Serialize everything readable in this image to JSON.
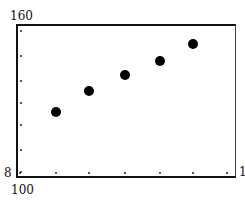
{
  "chart_data": {
    "type": "scatter",
    "title": "",
    "xlabel": "",
    "ylabel": "",
    "tick_labels": {
      "y_top": "160",
      "y_bottom": "8",
      "x_left": "100",
      "x_right": "1"
    },
    "x": [
      1,
      2,
      3,
      4,
      5
    ],
    "y": [
      112,
      91,
      75,
      61,
      44
    ],
    "points_px": [
      {
        "x": 56,
        "y": 112
      },
      {
        "x": 89,
        "y": 91
      },
      {
        "x": 125,
        "y": 75
      },
      {
        "x": 160,
        "y": 61
      },
      {
        "x": 193,
        "y": 44
      }
    ],
    "series": [
      {
        "name": "points",
        "values_relative": [
          0.42,
          0.55,
          0.66,
          0.75,
          0.86
        ]
      }
    ],
    "x_ticks_px": [
      20,
      56,
      89,
      125,
      160,
      193,
      227
    ],
    "y_ticks_px": [
      31,
      56,
      81,
      103,
      125,
      150,
      172
    ],
    "grid": false,
    "legend": null,
    "marker_color": "#000000",
    "frame_color": "#111111"
  }
}
